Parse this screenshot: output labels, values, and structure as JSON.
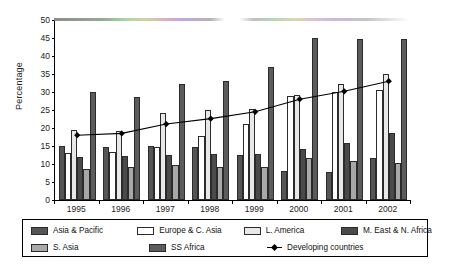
{
  "chart_data": {
    "type": "bar",
    "title": "",
    "xlabel": "",
    "ylabel": "Percentage",
    "ylim": [
      0,
      50
    ],
    "ytick_values": [
      0,
      5,
      10,
      15,
      20,
      25,
      30,
      35,
      40,
      45,
      50
    ],
    "grid": false,
    "legend_position": "bottom",
    "categories": [
      "1995",
      "1996",
      "1997",
      "1998",
      "1999",
      "2000",
      "2001",
      "2002"
    ],
    "series": [
      {
        "name": "Asia & Pacific",
        "type": "bar",
        "color": "#555555",
        "values": [
          15.0,
          14.6,
          15.1,
          14.7,
          12.6,
          8.1,
          7.7,
          11.6
        ]
      },
      {
        "name": "Europe & C. Asia",
        "type": "bar",
        "color": "#ffffff",
        "values": [
          13.0,
          13.2,
          14.7,
          17.9,
          21.0,
          28.8,
          30.0,
          30.5
        ]
      },
      {
        "name": "L. America",
        "type": "bar",
        "color": "#e8e8e8",
        "values": [
          19.4,
          19.1,
          24.2,
          25.0,
          25.4,
          29.3,
          32.3,
          35.0
        ]
      },
      {
        "name": "M. East & N. Africa",
        "type": "bar",
        "color": "#4a4a4a",
        "values": [
          11.9,
          12.2,
          12.4,
          12.7,
          12.7,
          14.3,
          15.7,
          18.6
        ]
      },
      {
        "name": "S. Asia",
        "type": "bar",
        "color": "#a8a8a8",
        "values": [
          8.6,
          9.2,
          9.6,
          9.2,
          9.3,
          11.8,
          10.7,
          10.3
        ]
      },
      {
        "name": "SS Africa",
        "type": "bar",
        "color": "#5c5c5c",
        "values": [
          30.1,
          28.7,
          32.3,
          33.1,
          37.0,
          45.0,
          44.6,
          44.6
        ]
      },
      {
        "name": "Developing countries",
        "type": "line",
        "color": "#000000",
        "values": [
          18.0,
          18.5,
          21.1,
          22.6,
          24.5,
          28.0,
          30.2,
          33.0
        ]
      }
    ]
  },
  "legend": {
    "row1": [
      "Asia & Pacific",
      "Europe & C. Asia",
      "L. America",
      "M. East & N. Africa"
    ],
    "row2": [
      "S. Asia",
      "SS Africa",
      "Developing countries"
    ]
  }
}
